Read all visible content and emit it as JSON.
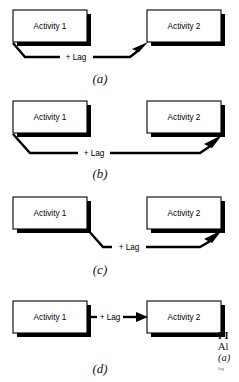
{
  "figure": {
    "type": "diagram",
    "panels": [
      {
        "id": "a",
        "label": "(a)",
        "relationship": "finish-to-start with lag",
        "from_box": "Activity 1",
        "to_box": "Activity 2",
        "link_label": "+ Lag",
        "link_start": "bottom-left of Activity 1",
        "link_end": "bottom-left of Activity 2",
        "arrowhead": "up-right"
      },
      {
        "id": "b",
        "label": "(b)",
        "relationship": "start-to-finish with lag",
        "from_box": "Activity 1",
        "to_box": "Activity 2",
        "link_label": "+ Lag",
        "link_start": "bottom-left of Activity 1",
        "link_end": "bottom-right of Activity 2",
        "arrowhead": "up-right"
      },
      {
        "id": "c",
        "label": "(c)",
        "relationship": "finish-to-finish with lag",
        "from_box": "Activity 1",
        "to_box": "Activity 2",
        "link_label": "+ Lag",
        "link_start": "bottom-right of Activity 1",
        "link_end": "bottom-right of Activity 2",
        "arrowhead": "up-right"
      },
      {
        "id": "d",
        "label": "(d)",
        "relationship": "finish-to-start direct with lag",
        "from_box": "Activity 1",
        "to_box": "Activity 2",
        "link_label": "+ Lag",
        "link_start": "right edge of Activity 1",
        "link_end": "left edge of Activity 2",
        "arrowhead": "right"
      }
    ],
    "box_labels": {
      "activity_1": "Activity 1",
      "activity_2": "Activity 2"
    },
    "link_label": "+ Lag",
    "colors": {
      "stroke": "#000000",
      "box_fill": "#ffffff",
      "shadow": "#000000",
      "text": "#000000"
    }
  },
  "caption": {
    "fig_word": "FI",
    "line1": "Al",
    "item_a": "(a)",
    "line_small": "lag"
  }
}
